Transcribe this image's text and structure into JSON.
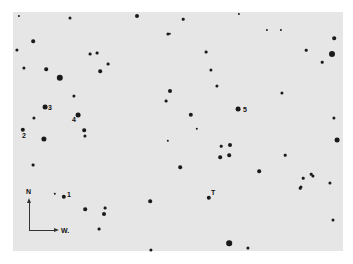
{
  "chart": {
    "compass": {
      "north_label": "N",
      "west_label": "W."
    },
    "labels": [
      {
        "text": "3",
        "x": 48,
        "y": 104
      },
      {
        "text": "2",
        "x": 22,
        "y": 132
      },
      {
        "text": "4",
        "x": 72,
        "y": 116
      },
      {
        "text": "5",
        "x": 243,
        "y": 106
      },
      {
        "text": "1",
        "x": 67,
        "y": 191
      },
      {
        "text": "T",
        "x": 211,
        "y": 189
      }
    ],
    "stars": [
      {
        "x": 45,
        "y": 107,
        "r": 2.4
      },
      {
        "x": 23,
        "y": 130,
        "r": 2.2
      },
      {
        "x": 78,
        "y": 115,
        "r": 2.4
      },
      {
        "x": 238,
        "y": 109,
        "r": 2.4
      },
      {
        "x": 64,
        "y": 197,
        "r": 2.2
      },
      {
        "x": 209,
        "y": 198,
        "r": 2.2
      },
      {
        "x": 60,
        "y": 78,
        "r": 3.2
      },
      {
        "x": 44,
        "y": 139,
        "r": 2.6
      },
      {
        "x": 332,
        "y": 54,
        "r": 3.0
      },
      {
        "x": 337,
        "y": 140,
        "r": 2.4
      },
      {
        "x": 229,
        "y": 243,
        "r": 2.8
      },
      {
        "x": 191,
        "y": 115,
        "r": 2.2
      },
      {
        "x": 170,
        "y": 91,
        "r": 2.0
      },
      {
        "x": 137,
        "y": 16,
        "r": 2.0
      },
      {
        "x": 334,
        "y": 38,
        "r": 1.8
      },
      {
        "x": 33,
        "y": 41,
        "r": 1.8
      },
      {
        "x": 46,
        "y": 69,
        "r": 1.8
      },
      {
        "x": 17,
        "y": 50,
        "r": 1.6
      },
      {
        "x": 24,
        "y": 68,
        "r": 1.6
      },
      {
        "x": 100,
        "y": 71,
        "r": 1.8
      },
      {
        "x": 74,
        "y": 96,
        "r": 1.6
      },
      {
        "x": 34,
        "y": 118,
        "r": 1.6
      },
      {
        "x": 84,
        "y": 130,
        "r": 1.8
      },
      {
        "x": 85,
        "y": 136,
        "r": 1.6
      },
      {
        "x": 70,
        "y": 18,
        "r": 1.5
      },
      {
        "x": 168,
        "y": 34,
        "r": 1.6
      },
      {
        "x": 211,
        "y": 70,
        "r": 1.6
      },
      {
        "x": 217,
        "y": 86,
        "r": 1.6
      },
      {
        "x": 230,
        "y": 145,
        "r": 2.0
      },
      {
        "x": 229,
        "y": 155,
        "r": 1.8
      },
      {
        "x": 220,
        "y": 157,
        "r": 1.8
      },
      {
        "x": 180,
        "y": 167,
        "r": 1.8
      },
      {
        "x": 259,
        "y": 171,
        "r": 1.8
      },
      {
        "x": 150,
        "y": 201,
        "r": 1.8
      },
      {
        "x": 85,
        "y": 209,
        "r": 1.8
      },
      {
        "x": 104,
        "y": 214,
        "r": 2.0
      },
      {
        "x": 151,
        "y": 250,
        "r": 1.6
      },
      {
        "x": 248,
        "y": 248,
        "r": 1.6
      },
      {
        "x": 301,
        "y": 187,
        "r": 1.6
      },
      {
        "x": 313,
        "y": 176,
        "r": 1.6
      },
      {
        "x": 330,
        "y": 183,
        "r": 1.6
      },
      {
        "x": 333,
        "y": 220,
        "r": 1.5
      },
      {
        "x": 334,
        "y": 118,
        "r": 1.6
      },
      {
        "x": 282,
        "y": 93,
        "r": 1.6
      },
      {
        "x": 206,
        "y": 52,
        "r": 1.4
      },
      {
        "x": 166,
        "y": 101,
        "r": 1.4
      },
      {
        "x": 90,
        "y": 54,
        "r": 1.4
      },
      {
        "x": 97,
        "y": 53,
        "r": 1.4
      },
      {
        "x": 108,
        "y": 64,
        "r": 1.4
      },
      {
        "x": 33,
        "y": 165,
        "r": 1.4
      },
      {
        "x": 105,
        "y": 208,
        "r": 1.4
      },
      {
        "x": 99,
        "y": 229,
        "r": 1.4
      },
      {
        "x": 221,
        "y": 146,
        "r": 1.3
      },
      {
        "x": 285,
        "y": 155,
        "r": 1.3
      },
      {
        "x": 311,
        "y": 174,
        "r": 1.3
      },
      {
        "x": 303,
        "y": 178,
        "r": 1.3
      },
      {
        "x": 183,
        "y": 19,
        "r": 1.3
      },
      {
        "x": 306,
        "y": 50,
        "r": 1.3
      },
      {
        "x": 322,
        "y": 62,
        "r": 1.3
      },
      {
        "x": 300,
        "y": 188,
        "r": 1.3
      },
      {
        "x": 170,
        "y": 34,
        "r": 1.2
      },
      {
        "x": 197,
        "y": 129,
        "r": 1.2
      },
      {
        "x": 168,
        "y": 141,
        "r": 1.2
      },
      {
        "x": 55,
        "y": 194,
        "r": 1.2
      },
      {
        "x": 19,
        "y": 16,
        "r": 1.1
      },
      {
        "x": 239,
        "y": 14,
        "r": 1.1
      },
      {
        "x": 267,
        "y": 30,
        "r": 1.1
      },
      {
        "x": 281,
        "y": 30,
        "r": 1.1
      }
    ]
  }
}
